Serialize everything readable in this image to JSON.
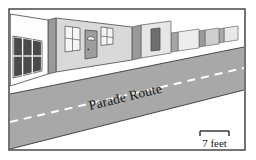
{
  "figure": {
    "kind": "perspective-street-illustration",
    "frame_border_color": "#3a3a3a",
    "background_color": "#ffffff"
  },
  "road": {
    "label": "Parade Route",
    "surface_color": "#a8a8a8",
    "edge_color": "#4a4a4a",
    "center_line": {
      "name": "dashed-center-line",
      "color": "#ffffff",
      "style": "dashed"
    }
  },
  "sidewalk": {
    "color": "#ffffff",
    "edge_color": "#555555"
  },
  "scale_bar": {
    "label": "7 feet",
    "color": "#1a1a1a"
  },
  "buildings": [
    {
      "name": "building-left-white",
      "face_color": "#fdfdfd",
      "side_color": "#bdbdbd",
      "windows": 1
    },
    {
      "name": "building-second-gray",
      "face_color": "#d9d9d9",
      "side_color": "#9a9a9a",
      "windows": 2,
      "doors": 1
    },
    {
      "name": "building-third",
      "face_color": "#e6e6e6",
      "side_color": "#9a9a9a",
      "doors": 1
    },
    {
      "name": "building-fourth",
      "face_color": "#ededed",
      "side_color": "#a5a5a5"
    },
    {
      "name": "building-fifth",
      "face_color": "#e0e0e0",
      "side_color": "#a0a0a0"
    },
    {
      "name": "building-sixth-far",
      "face_color": "#e8e8e8",
      "side_color": "#a8a8a8"
    }
  ],
  "doors": [
    {
      "name": "door-arched-window",
      "color": "#9e9e9e",
      "frame": "#5a5a5a"
    },
    {
      "name": "door-dark",
      "color": "#6e6e6e",
      "frame": "#4a4a4a"
    }
  ],
  "windows": [
    {
      "name": "window-dark-6pane",
      "glass": "#4a4a4a",
      "frame": "#ffffff"
    },
    {
      "name": "window-light-4pane-left",
      "glass": "#f5f5f5",
      "frame": "#5a5a5a"
    },
    {
      "name": "window-light-4pane-right",
      "glass": "#f5f5f5",
      "frame": "#5a5a5a"
    }
  ]
}
